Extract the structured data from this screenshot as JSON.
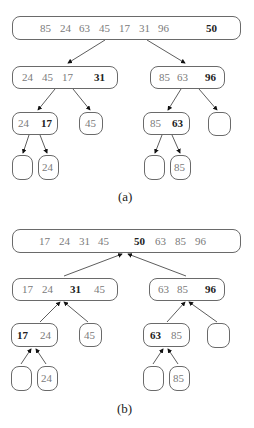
{
  "diagram_a": {
    "caption": "(a)",
    "root": {
      "values": [
        "85",
        "24",
        "63",
        "45",
        "17",
        "31",
        "96"
      ],
      "pivot": "50"
    },
    "left": {
      "values": [
        "24",
        "45",
        "17"
      ],
      "pivot": "31"
    },
    "right": {
      "values": [
        "85",
        "63"
      ],
      "pivot": "96"
    },
    "left_left": {
      "values": [
        "24"
      ],
      "pivot": "17"
    },
    "left_right": {
      "values": [
        "45"
      ]
    },
    "right_left": {
      "values": [
        "85"
      ],
      "pivot": "63"
    },
    "right_right": {
      "values": []
    },
    "ll_left": {
      "values": []
    },
    "ll_right": {
      "values": [
        "24"
      ]
    },
    "rl_left": {
      "values": []
    },
    "rl_right": {
      "values": [
        "85"
      ]
    }
  },
  "diagram_b": {
    "caption": "(b)",
    "root": {
      "left_values": [
        "17",
        "24",
        "31",
        "45"
      ],
      "pivot": "50",
      "right_values": [
        "63",
        "85",
        "96"
      ]
    },
    "left": {
      "left_values": [
        "17",
        "24"
      ],
      "pivot": "31",
      "right_values": [
        "45"
      ]
    },
    "right": {
      "left_values": [
        "63",
        "85"
      ],
      "pivot": "96",
      "right_values": []
    },
    "left_left": {
      "pivot": "17",
      "right_values": [
        "24"
      ]
    },
    "left_right": {
      "values": [
        "45"
      ]
    },
    "right_left": {
      "pivot": "63",
      "right_values": [
        "85"
      ]
    },
    "right_right": {
      "values": []
    },
    "ll_left": {
      "values": []
    },
    "ll_right": {
      "values": [
        "24"
      ]
    },
    "rl_left": {
      "values": []
    },
    "rl_right": {
      "values": [
        "85"
      ]
    }
  }
}
